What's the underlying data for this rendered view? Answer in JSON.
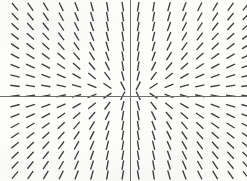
{
  "figure": {
    "width": 247,
    "height": 181,
    "background_color": "#fdfdfc",
    "title": "",
    "caption": ""
  },
  "axes": {
    "origin_px": {
      "x": 130.5,
      "y": 96.5
    },
    "color": "#6f6f6f",
    "stroke_width": 1.1,
    "x_axis_label": "",
    "y_axis_label": "",
    "x_tick_labels": [],
    "y_tick_labels": [],
    "grid_visible": false,
    "frame_visible": false
  },
  "chart_data": {
    "type": "scatter",
    "plot_kind": "slope-field",
    "title": "",
    "subtitle": "",
    "xlabel": "",
    "ylabel": "",
    "equation": "dy/dx = y/x",
    "xlim": [
      -8.5,
      7.5
    ],
    "ylim": [
      -8.5,
      8.5
    ],
    "grid": false,
    "legend": [],
    "annotations": [],
    "segment_color": "#3c3c3c",
    "segment_stroke_width": 1.35,
    "segment_length_px": 9.5,
    "columns": 16,
    "rows": 18,
    "x_spacing_px": 15.4,
    "y_spacing_px": 9.9,
    "x_first_px": 15.0,
    "y_first_px": 6.7,
    "x_values": [
      -7.5,
      -6.5,
      -5.5,
      -4.5,
      -3.5,
      -2.5,
      -1.5,
      -0.5,
      0.5,
      1.5,
      2.5,
      3.5,
      4.5,
      5.5,
      6.5,
      7.5
    ],
    "y_values": [
      9,
      8,
      7,
      6,
      5,
      4,
      3,
      2,
      1,
      -1,
      -2,
      -3,
      -4,
      -5,
      -6,
      -7,
      -8,
      -9
    ],
    "slope_rule": "y_over_x",
    "slope_clamp": 6.0
  }
}
